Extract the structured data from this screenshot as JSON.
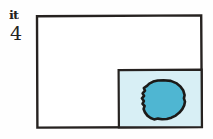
{
  "figure": {
    "background_color": "#fefefe",
    "ink_color": "#262220",
    "annotations": {
      "mark_label": "it",
      "number_label": "4"
    },
    "outer_rectangle": {
      "name": "outer-frame",
      "x": 36,
      "y": 15,
      "width": 166,
      "height": 113,
      "stroke_color": "#262220",
      "fill_color": "#ffffff",
      "stroke_width": 2.4
    },
    "inner_rectangle": {
      "name": "inset-panel",
      "x": 118,
      "y": 69,
      "width": 84,
      "height": 59,
      "stroke_color": "#262220",
      "fill_color": "#d8eff5",
      "stroke_width": 2.2
    },
    "blob": {
      "name": "shaded-blob",
      "center_x": 163,
      "center_y": 101,
      "radius_x": 22,
      "radius_y": 20,
      "fill_color": "#4fb6d2",
      "stroke_color": "#1c1a18",
      "stroke_width": 2.6,
      "outline_points": "163.5,80.2 170.8,80.9 176.2,83.1 180.4,86.4 183.3,90.6 184.6,95.2 183.9,98.4 185.0,101.6 184.2,105.4 182.3,109.2 179.4,112.6 175.7,115.6 171.4,117.7 166.8,119.0 162.1,119.3 157.9,118.6 154.1,119.4 150.6,118.0 147.4,115.6 145.0,112.4 143.6,108.9 144.6,106.0 142.5,103.8 143.9,101.0 141.9,98.3 144.1,95.8 142.6,93.3 145.0,90.7 143.8,88.0 146.6,86.2 149.3,83.6 153.2,81.6 157.8,80.5"
    }
  }
}
